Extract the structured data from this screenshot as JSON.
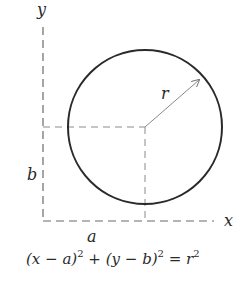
{
  "diagram": {
    "labels": {
      "y_axis": "y",
      "x_axis": "x",
      "radius": "r",
      "center_x": "a",
      "center_y": "b"
    },
    "equation": {
      "p1": "(x − a)",
      "e1": "2",
      "p2": " + (y − b)",
      "e2": "2",
      "p3": " = r",
      "e3": "2"
    },
    "colors": {
      "stroke": "#2a2a2a",
      "dash": "#6a6a6a",
      "arrow": "#8a8a8a"
    }
  }
}
